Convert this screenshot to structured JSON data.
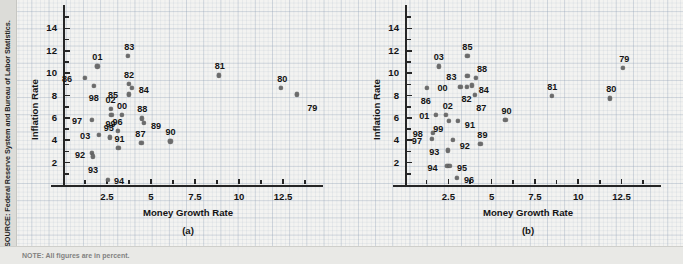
{
  "source_note": "SOURCE: Federal Reserve System and Bureau of Labor Statistics.",
  "bottom_note": "NOTE: All figures are in percent.",
  "colors": {
    "point": "#6b6b6b",
    "axis": "#262626",
    "text": "#141414",
    "page_bg": "#f3f3f1",
    "strip_bg": "#dcdcd8"
  },
  "chart_data": [
    {
      "type": "scatter",
      "panel": "a",
      "title": "",
      "subcaption": "(a)",
      "xlabel": "Money Growth Rate",
      "ylabel": "Inflation Rate",
      "xlim": [
        0,
        14.2
      ],
      "ylim": [
        0,
        15.2
      ],
      "xticks": [
        2.5,
        5,
        7.5,
        10,
        12.5
      ],
      "xtick_labels": [
        "2.5",
        "5",
        "7.5",
        "10",
        "12.5"
      ],
      "yticks": [
        2,
        4,
        6,
        8,
        10,
        12,
        14
      ],
      "ytick_labels": [
        "2",
        "4",
        "6",
        "8",
        "10",
        "12",
        "14"
      ],
      "grid": false,
      "legend": "none",
      "point_label_position": "varies",
      "points": [
        {
          "label": "79",
          "x": 13.3,
          "y": 8.1,
          "lx": 10,
          "ly": 10
        },
        {
          "label": "80",
          "x": 12.4,
          "y": 8.7,
          "lx": -4,
          "ly": -13
        },
        {
          "label": "81",
          "x": 8.85,
          "y": 9.8,
          "lx": -4,
          "ly": -13
        },
        {
          "label": "82",
          "x": 3.75,
          "y": 9.05,
          "lx": -5,
          "ly": -13
        },
        {
          "label": "83",
          "x": 3.7,
          "y": 11.55,
          "lx": -4,
          "ly": -13
        },
        {
          "label": "84",
          "x": 3.9,
          "y": 8.65,
          "lx": 7,
          "ly": -2
        },
        {
          "label": "85",
          "x": 3.75,
          "y": 8.1,
          "lx": -21,
          "ly": -3
        },
        {
          "label": "86",
          "x": 1.25,
          "y": 9.55,
          "lx": -23,
          "ly": -3
        },
        {
          "label": "87",
          "x": 4.45,
          "y": 3.75,
          "lx": -6,
          "ly": -13
        },
        {
          "label": "88",
          "x": 4.5,
          "y": 5.95,
          "lx": -5,
          "ly": -13
        },
        {
          "label": "89",
          "x": 4.6,
          "y": 5.55,
          "lx": 7,
          "ly": -1
        },
        {
          "label": "90",
          "x": 6.1,
          "y": 3.9,
          "lx": -5,
          "ly": -13
        },
        {
          "label": "91",
          "x": 3.15,
          "y": 3.3,
          "lx": -4,
          "ly": -13
        },
        {
          "label": "92",
          "x": 1.65,
          "y": 2.85,
          "lx": -17,
          "ly": -2
        },
        {
          "label": "93",
          "x": 1.7,
          "y": 2.55,
          "lx": -5,
          "ly": 10
        },
        {
          "label": "94",
          "x": 2.55,
          "y": 0.45,
          "lx": 6,
          "ly": -3
        },
        {
          "label": "95",
          "x": 2.65,
          "y": 4.25,
          "lx": -6,
          "ly": -13
        },
        {
          "label": "96",
          "x": 3.1,
          "y": 4.85,
          "lx": -5,
          "ly": -13
        },
        {
          "label": "97",
          "x": 1.65,
          "y": 5.8,
          "lx": -20,
          "ly": -3
        },
        {
          "label": "98",
          "x": 1.75,
          "y": 8.85,
          "lx": -5,
          "ly": 8
        },
        {
          "label": "99",
          "x": 2.75,
          "y": 6.3,
          "lx": -6,
          "ly": 5
        },
        {
          "label": "00",
          "x": 3.35,
          "y": 6.25,
          "lx": -5,
          "ly": -13
        },
        {
          "label": "01",
          "x": 1.95,
          "y": 10.6,
          "lx": -5,
          "ly": -13
        },
        {
          "label": "02",
          "x": 2.7,
          "y": 6.8,
          "lx": -5,
          "ly": -13
        },
        {
          "label": "03",
          "x": 2.05,
          "y": 4.5,
          "lx": -19,
          "ly": -3
        }
      ]
    },
    {
      "type": "scatter",
      "panel": "b",
      "title": "",
      "subcaption": "(b)",
      "xlabel": "Money Growth Rate",
      "ylabel": "Inflation Rate",
      "xlim": [
        0,
        14.2
      ],
      "ylim": [
        0,
        15.2
      ],
      "xticks": [
        2.5,
        5,
        7.5,
        10,
        12.5
      ],
      "xtick_labels": [
        "2.5",
        "5",
        "7.5",
        "10",
        "12.5"
      ],
      "yticks": [
        2,
        4,
        6,
        8,
        10,
        12,
        14
      ],
      "ytick_labels": [
        "2",
        "4",
        "6",
        "8",
        "10",
        "12",
        "14"
      ],
      "grid": false,
      "legend": "none",
      "points": [
        {
          "label": "79",
          "x": 12.6,
          "y": 10.45,
          "lx": -4,
          "ly": -13
        },
        {
          "label": "80",
          "x": 11.85,
          "y": 7.75,
          "lx": -4,
          "ly": -13
        },
        {
          "label": "81",
          "x": 8.5,
          "y": 8.0,
          "lx": -5,
          "ly": -13
        },
        {
          "label": "82",
          "x": 3.55,
          "y": 8.75,
          "lx": -5,
          "ly": 8
        },
        {
          "label": "83",
          "x": 3.6,
          "y": 9.75,
          "lx": -21,
          "ly": -3
        },
        {
          "label": "84",
          "x": 3.85,
          "y": 8.9,
          "lx": 7,
          "ly": 1
        },
        {
          "label": "85",
          "x": 3.6,
          "y": 11.55,
          "lx": -5,
          "ly": -13
        },
        {
          "label": "86",
          "x": 1.25,
          "y": 8.65,
          "lx": -6,
          "ly": 9
        },
        {
          "label": "87",
          "x": 4.05,
          "y": 8.05,
          "lx": 1,
          "ly": 9
        },
        {
          "label": "88",
          "x": 4.1,
          "y": 9.55,
          "lx": 1,
          "ly": -13
        },
        {
          "label": "89",
          "x": 4.35,
          "y": 3.65,
          "lx": -3,
          "ly": -13
        },
        {
          "label": "90",
          "x": 5.8,
          "y": 5.85,
          "lx": -4,
          "ly": -13
        },
        {
          "label": "91",
          "x": 3.05,
          "y": 5.7,
          "lx": 7,
          "ly": 0
        },
        {
          "label": "92",
          "x": 2.75,
          "y": 4.0,
          "lx": 7,
          "ly": 2
        },
        {
          "label": "93",
          "x": 2.5,
          "y": 3.1,
          "lx": -19,
          "ly": -2
        },
        {
          "label": "94",
          "x": 2.45,
          "y": 1.7,
          "lx": -20,
          "ly": -2
        },
        {
          "label": "95",
          "x": 2.6,
          "y": 1.7,
          "lx": 7,
          "ly": -2
        },
        {
          "label": "96",
          "x": 3.0,
          "y": 0.6,
          "lx": 7,
          "ly": -2
        },
        {
          "label": "97",
          "x": 1.55,
          "y": 4.1,
          "lx": -20,
          "ly": -2
        },
        {
          "label": "98",
          "x": 1.6,
          "y": 4.65,
          "lx": -20,
          "ly": -3
        },
        {
          "label": "99",
          "x": 2.55,
          "y": 5.7,
          "lx": -16,
          "ly": 4
        },
        {
          "label": "00",
          "x": 3.2,
          "y": 8.75,
          "lx": -23,
          "ly": -3
        },
        {
          "label": "01",
          "x": 1.8,
          "y": 6.25,
          "lx": -17,
          "ly": -3
        },
        {
          "label": "02",
          "x": 2.35,
          "y": 6.25,
          "lx": -3,
          "ly": -13
        },
        {
          "label": "03",
          "x": 1.95,
          "y": 10.6,
          "lx": -5,
          "ly": -13
        }
      ]
    }
  ]
}
